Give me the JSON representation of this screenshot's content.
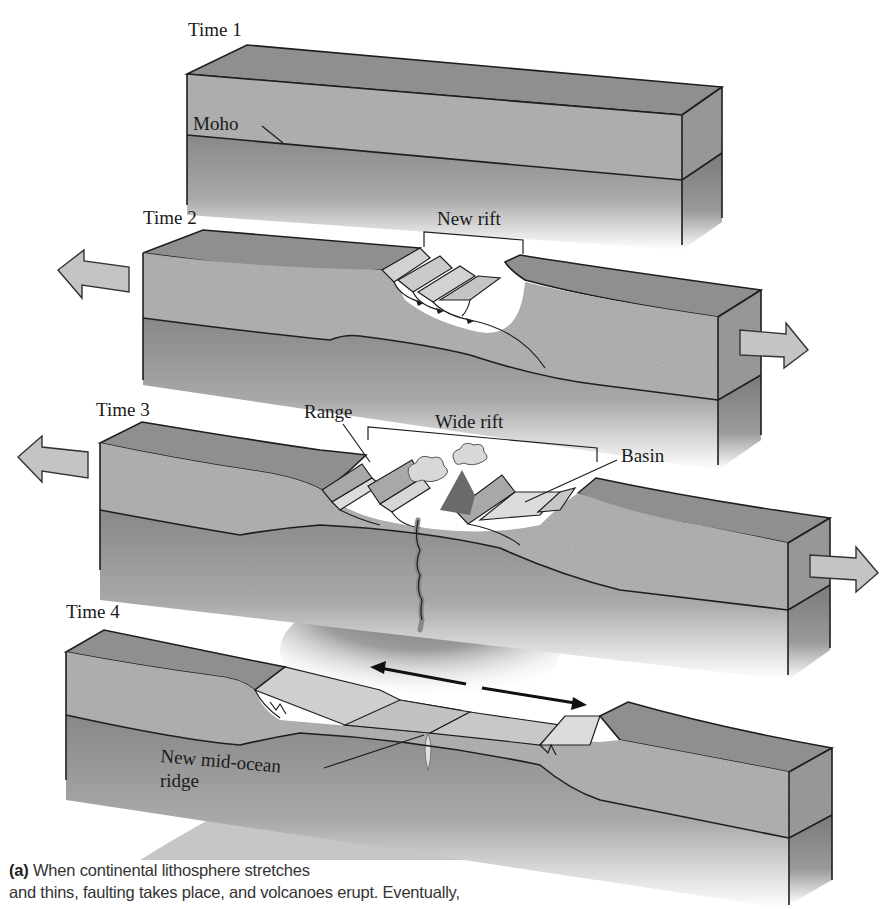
{
  "figure": {
    "panels": [
      {
        "id": "time1",
        "title": "Time 1",
        "labels": [
          "Moho"
        ]
      },
      {
        "id": "time2",
        "title": "Time 2",
        "labels": [
          "New rift"
        ]
      },
      {
        "id": "time3",
        "title": "Time 3",
        "labels": [
          "Range",
          "Wide rift",
          "Basin"
        ]
      },
      {
        "id": "time4",
        "title": "Time 4",
        "labels": [
          "New mid-ocean",
          "ridge"
        ]
      }
    ],
    "colors": {
      "top_surface": "#8f8f8f",
      "crust": "#b4b4b4",
      "mantle": "#8a8a8a",
      "fault_block": "#d2d2d2",
      "arrow_fill": "#c4c4c4",
      "outline": "#1e1e1e"
    }
  },
  "caption": {
    "part": "(a)",
    "line1": " When continental lithosphere stretches",
    "line2": "and thins, faulting takes place, and volcanoes erupt. Eventually,"
  }
}
